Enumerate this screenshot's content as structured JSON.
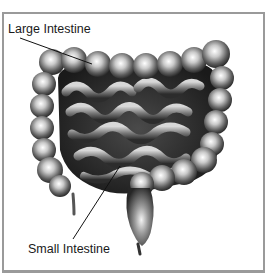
{
  "diagram": {
    "colors": {
      "frame": "#9a9a9a",
      "background": "#ffffff",
      "label_text": "#1a1a1a",
      "leader_line": "#111111"
    },
    "labels": [
      {
        "id": "large-intestine",
        "text": "Large Intestine"
      },
      {
        "id": "small-intestine",
        "text": "Small Intestine"
      }
    ]
  }
}
